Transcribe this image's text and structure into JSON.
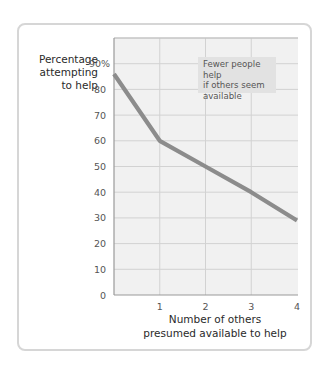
{
  "chart_data": {
    "type": "line",
    "title": "",
    "ylabel": "Percentage attempting to help",
    "xlabel": "Number of others presumed available to help",
    "x": [
      0,
      1,
      2,
      3,
      4
    ],
    "series": [
      {
        "name": "Percentage attempting to help",
        "values": [
          86,
          60,
          50,
          40,
          29
        ]
      }
    ],
    "xticks": [
      "1",
      "2",
      "3",
      "4"
    ],
    "yticks": [
      "0",
      "10",
      "20",
      "30",
      "40",
      "50",
      "60",
      "70",
      "80",
      "90%"
    ],
    "xlim": [
      0,
      4
    ],
    "ylim": [
      0,
      100
    ],
    "grid": true,
    "annotation": "Fewer people help if others seem available",
    "line_color": "#8c8c8c"
  },
  "labels": {
    "ylabel_lines": [
      "Percentage",
      "attempting",
      "to help"
    ],
    "xlabel_lines": [
      "Number of others",
      "presumed available to help"
    ],
    "annotation_lines": [
      "Fewer people help",
      "if others seem",
      "available"
    ]
  }
}
